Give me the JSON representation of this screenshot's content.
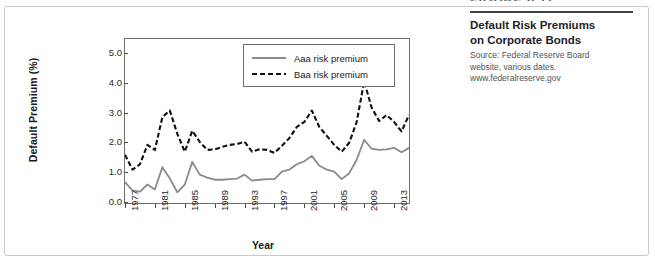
{
  "figure": {
    "number_label": "FIGURE 6.11",
    "title_line_1": "Default Risk Premiums",
    "title_line_2": "on Corporate Bonds",
    "source": "Source: Federal Reserve Board website, various dates. www.federalreserve.gov"
  },
  "chart_data": {
    "type": "line",
    "title": "",
    "xlabel": "Year",
    "ylabel": "Default Premium (%)",
    "xlim": [
      1977,
      2015
    ],
    "ylim": [
      0.0,
      5.5
    ],
    "grid": false,
    "legend_position": "top-right",
    "ytick_labels": [
      "0.0",
      "1.0",
      "2.0",
      "3.0",
      "4.0",
      "5.0"
    ],
    "ytick_values": [
      0.0,
      1.0,
      2.0,
      3.0,
      4.0,
      5.0
    ],
    "xtick_labels": [
      "1977",
      "1981",
      "1985",
      "1989",
      "1993",
      "1997",
      "2001",
      "2005",
      "2009",
      "2013"
    ],
    "xtick_values": [
      1977,
      1981,
      1985,
      1989,
      1993,
      1997,
      2001,
      2005,
      2009,
      2013
    ],
    "x": [
      1977,
      1978,
      1979,
      1980,
      1981,
      1982,
      1983,
      1984,
      1985,
      1986,
      1987,
      1988,
      1989,
      1990,
      1991,
      1992,
      1993,
      1994,
      1995,
      1996,
      1997,
      1998,
      1999,
      2000,
      2001,
      2002,
      2003,
      2004,
      2005,
      2006,
      2007,
      2008,
      2009,
      2010,
      2011,
      2012,
      2013,
      2014,
      2015
    ],
    "series": [
      {
        "name": "Aaa risk premium",
        "style": "solid",
        "color": "#8a8a8a",
        "values": [
          0.7,
          0.42,
          0.38,
          0.62,
          0.45,
          1.2,
          0.82,
          0.36,
          0.62,
          1.38,
          0.95,
          0.85,
          0.78,
          0.78,
          0.8,
          0.82,
          0.95,
          0.75,
          0.78,
          0.8,
          0.8,
          1.05,
          1.12,
          1.3,
          1.4,
          1.58,
          1.25,
          1.12,
          1.05,
          0.8,
          1.0,
          1.45,
          2.12,
          1.82,
          1.78,
          1.8,
          1.85,
          1.7,
          1.85
        ]
      },
      {
        "name": "Baa risk premium",
        "style": "dashed",
        "color": "#111111",
        "values": [
          1.62,
          1.12,
          1.3,
          1.95,
          1.78,
          2.88,
          3.1,
          2.32,
          1.72,
          2.42,
          2.05,
          1.78,
          1.8,
          1.88,
          1.95,
          1.98,
          2.05,
          1.72,
          1.8,
          1.78,
          1.68,
          1.92,
          2.18,
          2.55,
          2.72,
          3.1,
          2.55,
          2.25,
          1.95,
          1.72,
          2.02,
          2.72,
          4.08,
          3.2,
          2.75,
          2.95,
          2.72,
          2.4,
          2.95
        ]
      }
    ]
  }
}
